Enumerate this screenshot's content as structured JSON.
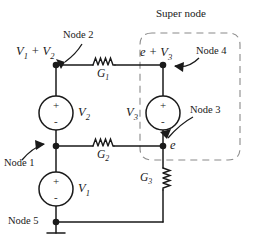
{
  "diagram": {
    "background_color": "#ffffff",
    "line_color": "#1a1a1a",
    "dashed_color": "#8a8a8a",
    "annotations": {
      "super_node": "Super node",
      "node1": "Node 1",
      "node2": "Node 2",
      "node3": "Node 3",
      "node4": "Node 4",
      "node5": "Node 5"
    },
    "node_voltages": {
      "node2_expr": "V",
      "node2_expr_sub1": "1",
      "node2_expr_mid": " + V",
      "node2_expr_sub2": "2",
      "node4_expr": "e + V",
      "node4_expr_sub": "3",
      "node3_expr": "e"
    },
    "sources": [
      {
        "name": "V1",
        "label": "V",
        "label_sub": "1",
        "plus": "+",
        "minus": "-",
        "label_side": "right"
      },
      {
        "name": "V2",
        "label": "V",
        "label_sub": "2",
        "plus": "+",
        "minus": "-",
        "label_side": "right"
      },
      {
        "name": "V3",
        "label": "V",
        "label_sub": "3",
        "plus": "+",
        "minus": "-",
        "label_side": "left"
      }
    ],
    "conductances": [
      {
        "name": "G1",
        "label": "G",
        "label_sub": "1",
        "orientation": "horizontal"
      },
      {
        "name": "G2",
        "label": "G",
        "label_sub": "2",
        "orientation": "horizontal"
      },
      {
        "name": "G3",
        "label": "G",
        "label_sub": "3",
        "orientation": "vertical"
      }
    ],
    "ground": {
      "at_node": "Node 5"
    }
  }
}
